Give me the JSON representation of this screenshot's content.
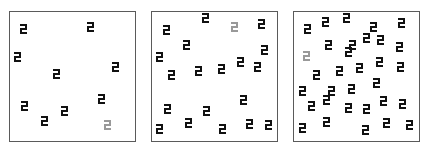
{
  "colors": {
    "target": "#111111",
    "distractor_odd": "#999999",
    "border": "#5a5a5a",
    "background": "#ffffff"
  },
  "glyph_icon": "block-2-shape",
  "panels": [
    {
      "id": "panel-1",
      "left": 9,
      "set_size": 10,
      "items": [
        {
          "x": 20,
          "y": 24,
          "tone": "dark"
        },
        {
          "x": 87,
          "y": 22,
          "tone": "dark"
        },
        {
          "x": 14,
          "y": 52,
          "tone": "dark"
        },
        {
          "x": 53,
          "y": 69,
          "tone": "dark"
        },
        {
          "x": 112,
          "y": 62,
          "tone": "dark"
        },
        {
          "x": 21,
          "y": 101,
          "tone": "dark"
        },
        {
          "x": 41,
          "y": 116,
          "tone": "dark"
        },
        {
          "x": 61,
          "y": 106,
          "tone": "dark"
        },
        {
          "x": 98,
          "y": 94,
          "tone": "dark"
        },
        {
          "x": 104,
          "y": 120,
          "tone": "gray"
        }
      ]
    },
    {
      "id": "panel-2",
      "left": 151,
      "set_size": 20,
      "items": [
        {
          "x": 163,
          "y": 25,
          "tone": "dark"
        },
        {
          "x": 202,
          "y": 13,
          "tone": "dark"
        },
        {
          "x": 231,
          "y": 22,
          "tone": "gray"
        },
        {
          "x": 258,
          "y": 19,
          "tone": "dark"
        },
        {
          "x": 183,
          "y": 40,
          "tone": "dark"
        },
        {
          "x": 156,
          "y": 52,
          "tone": "dark"
        },
        {
          "x": 261,
          "y": 45,
          "tone": "dark"
        },
        {
          "x": 168,
          "y": 70,
          "tone": "dark"
        },
        {
          "x": 195,
          "y": 66,
          "tone": "dark"
        },
        {
          "x": 218,
          "y": 64,
          "tone": "dark"
        },
        {
          "x": 237,
          "y": 57,
          "tone": "dark"
        },
        {
          "x": 254,
          "y": 62,
          "tone": "dark"
        },
        {
          "x": 164,
          "y": 104,
          "tone": "dark"
        },
        {
          "x": 203,
          "y": 106,
          "tone": "dark"
        },
        {
          "x": 240,
          "y": 95,
          "tone": "dark"
        },
        {
          "x": 156,
          "y": 124,
          "tone": "dark"
        },
        {
          "x": 185,
          "y": 118,
          "tone": "dark"
        },
        {
          "x": 219,
          "y": 124,
          "tone": "dark"
        },
        {
          "x": 246,
          "y": 119,
          "tone": "dark"
        },
        {
          "x": 265,
          "y": 120,
          "tone": "dark"
        }
      ]
    },
    {
      "id": "panel-3",
      "left": 293,
      "set_size": 32,
      "items": [
        {
          "x": 304,
          "y": 24,
          "tone": "dark"
        },
        {
          "x": 322,
          "y": 17,
          "tone": "dark"
        },
        {
          "x": 343,
          "y": 13,
          "tone": "dark"
        },
        {
          "x": 370,
          "y": 22,
          "tone": "dark"
        },
        {
          "x": 398,
          "y": 18,
          "tone": "dark"
        },
        {
          "x": 363,
          "y": 33,
          "tone": "dark"
        },
        {
          "x": 349,
          "y": 40,
          "tone": "dark"
        },
        {
          "x": 377,
          "y": 35,
          "tone": "dark"
        },
        {
          "x": 396,
          "y": 42,
          "tone": "dark"
        },
        {
          "x": 325,
          "y": 40,
          "tone": "dark"
        },
        {
          "x": 345,
          "y": 47,
          "tone": "dark"
        },
        {
          "x": 303,
          "y": 51,
          "tone": "gray"
        },
        {
          "x": 313,
          "y": 70,
          "tone": "dark"
        },
        {
          "x": 336,
          "y": 66,
          "tone": "dark"
        },
        {
          "x": 356,
          "y": 63,
          "tone": "dark"
        },
        {
          "x": 376,
          "y": 57,
          "tone": "dark"
        },
        {
          "x": 397,
          "y": 62,
          "tone": "dark"
        },
        {
          "x": 299,
          "y": 86,
          "tone": "dark"
        },
        {
          "x": 328,
          "y": 86,
          "tone": "dark"
        },
        {
          "x": 348,
          "y": 84,
          "tone": "dark"
        },
        {
          "x": 373,
          "y": 78,
          "tone": "dark"
        },
        {
          "x": 308,
          "y": 101,
          "tone": "dark"
        },
        {
          "x": 323,
          "y": 95,
          "tone": "dark"
        },
        {
          "x": 345,
          "y": 103,
          "tone": "dark"
        },
        {
          "x": 363,
          "y": 104,
          "tone": "dark"
        },
        {
          "x": 380,
          "y": 96,
          "tone": "dark"
        },
        {
          "x": 399,
          "y": 99,
          "tone": "dark"
        },
        {
          "x": 299,
          "y": 123,
          "tone": "dark"
        },
        {
          "x": 323,
          "y": 117,
          "tone": "dark"
        },
        {
          "x": 362,
          "y": 125,
          "tone": "dark"
        },
        {
          "x": 383,
          "y": 118,
          "tone": "dark"
        },
        {
          "x": 406,
          "y": 120,
          "tone": "dark"
        }
      ]
    }
  ]
}
